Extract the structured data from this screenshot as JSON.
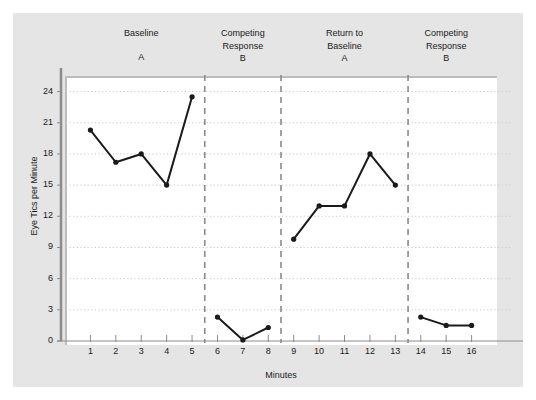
{
  "chart_data": {
    "type": "line",
    "title": "",
    "xlabel": "Minutes",
    "ylabel": "Eye Tics per Minute",
    "xlim": [
      0,
      17
    ],
    "ylim": [
      0,
      25.5
    ],
    "yticks": [
      0,
      3,
      6,
      9,
      12,
      15,
      18,
      21,
      24
    ],
    "xticks": [
      1,
      2,
      3,
      4,
      5,
      6,
      7,
      8,
      9,
      10,
      11,
      12,
      13,
      14,
      15,
      16
    ],
    "grid": "horizontal-dotted",
    "legend": "none",
    "marker": "filled-circle",
    "line_color": "#1a1a1a",
    "series": [
      {
        "name": "Baseline A",
        "x": [
          1,
          2,
          3,
          4,
          5
        ],
        "values": [
          20.3,
          17.2,
          18.0,
          15.0,
          23.5
        ]
      },
      {
        "name": "Competing Response B",
        "x": [
          6,
          7,
          8
        ],
        "values": [
          2.3,
          0.1,
          1.3
        ]
      },
      {
        "name": "Return to Baseline A",
        "x": [
          9,
          10,
          11,
          12,
          13
        ],
        "values": [
          9.8,
          13.0,
          13.0,
          18.0,
          15.0
        ]
      },
      {
        "name": "Competing Response B",
        "x": [
          14,
          15,
          16
        ],
        "values": [
          2.3,
          1.5,
          1.5
        ]
      }
    ],
    "phase_dividers": [
      5.5,
      8.5,
      13.5
    ],
    "phases": [
      {
        "name": "Baseline",
        "letter": "A",
        "x_center": 3.0
      },
      {
        "name": "Competing\nResponse",
        "letter": "B",
        "x_center": 7.0
      },
      {
        "name": "Return to\nBaseline",
        "letter": "A",
        "x_center": 11.0
      },
      {
        "name": "Competing\nResponse",
        "letter": "B",
        "x_center": 15.0
      }
    ]
  },
  "colors": {
    "panel_background": "#e5e5e5",
    "plot_background": "#ffffff",
    "axis": "#8c8c8c",
    "gridline": "#c8c8d2",
    "divider": "#8a8a8a",
    "text": "#1a1a1a"
  }
}
